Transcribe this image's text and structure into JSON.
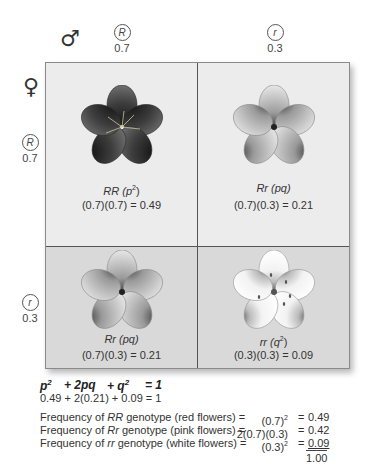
{
  "header": {
    "male_symbol": "♂",
    "female_symbol": "♀",
    "male_alleles": [
      {
        "allele": "R",
        "frequency": "0.7"
      },
      {
        "allele": "r",
        "frequency": "0.3"
      }
    ],
    "female_alleles": [
      {
        "allele": "R",
        "frequency": "0.7"
      },
      {
        "allele": "r",
        "frequency": "0.3"
      }
    ]
  },
  "grid": {
    "cells": [
      {
        "genotype": "RR",
        "term": "(p",
        "term_sup": "2",
        "term_close": ")",
        "calc": "(0.7)(0.7) = 0.49",
        "flower": "red-flower",
        "flower_color": "#3a3a3a"
      },
      {
        "genotype": "Rr",
        "term": "(pq)",
        "term_sup": "",
        "term_close": "",
        "calc": "(0.7)(0.3) = 0.21",
        "flower": "pink-flower",
        "flower_color": "#a8a8a8"
      },
      {
        "genotype": "Rr",
        "term": "(pq)",
        "term_sup": "",
        "term_close": "",
        "calc": "(0.7)(0.3) = 0.21",
        "flower": "pink-flower",
        "flower_color": "#a8a8a8"
      },
      {
        "genotype": "rr",
        "term": "(q",
        "term_sup": "2",
        "term_close": ")",
        "calc": "(0.3)(0.3) = 0.09",
        "flower": "white-flower",
        "flower_color": "#f4f4f4"
      }
    ]
  },
  "equations": {
    "hw_terms": [
      "p",
      "+ 2pq",
      "+ q",
      "= 1"
    ],
    "hw_sups": [
      "2",
      "",
      "2",
      ""
    ],
    "numeric": "0.49 + 2(0.21) + 0.09 = 1"
  },
  "frequencies": {
    "rows": [
      {
        "prefix": "Frequency of ",
        "genotype": "RR",
        "suffix": " genotype (red flowers) =",
        "expr": "(0.7)",
        "expr_sup": "2",
        "eq": "=",
        "value": "0.49"
      },
      {
        "prefix": "Frequency of ",
        "genotype": "Rr",
        "suffix": " genotype (pink flowers) =",
        "expr": "2(0.7)(0.3)",
        "expr_sup": "",
        "eq": "=",
        "value": "0.42"
      },
      {
        "prefix": "Frequency of ",
        "genotype": "rr",
        "suffix": " genotype (white flowers) =",
        "expr": "(0.3)",
        "expr_sup": "2",
        "eq": "=",
        "value": "0.09"
      }
    ],
    "total": "1.00"
  }
}
